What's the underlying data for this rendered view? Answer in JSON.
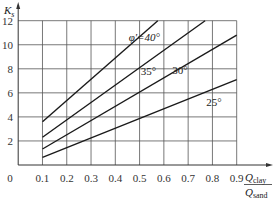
{
  "chart_data": {
    "type": "line",
    "title": "",
    "ylabel": "K_s",
    "ylabel_main": "K",
    "ylabel_sub": "s",
    "xlabel_numerator": "Q",
    "xlabel_numerator_sub": "clay",
    "xlabel_denominator": "Q",
    "xlabel_denominator_sub": "sand",
    "xlim": [
      0,
      0.9
    ],
    "ylim": [
      0,
      12
    ],
    "x_ticks": [
      0.1,
      0.2,
      0.3,
      0.4,
      0.5,
      0.6,
      0.7,
      0.8,
      0.9
    ],
    "x_tick_labels": [
      "0.1",
      "0.2",
      "0.3",
      "0.4",
      "0.5",
      "0.6",
      "0.7",
      "0.8",
      "0.9"
    ],
    "y_ticks": [
      2,
      4,
      6,
      8,
      10,
      12
    ],
    "y_tick_labels": [
      "2",
      "4",
      "6",
      "8",
      "10",
      "12"
    ],
    "origin_label": "0",
    "grid": true,
    "legend": "inline labels",
    "series": [
      {
        "name": "φ'=40°",
        "label": "φ'=40°",
        "x": [
          0.1,
          0.575
        ],
        "y": [
          3.6,
          12.0
        ]
      },
      {
        "name": "35°",
        "label": "35°",
        "x": [
          0.1,
          0.77
        ],
        "y": [
          2.3,
          12.0
        ]
      },
      {
        "name": "30°",
        "label": "30°",
        "x": [
          0.1,
          0.9
        ],
        "y": [
          1.33,
          10.8
        ]
      },
      {
        "name": "25°",
        "label": "25°",
        "x": [
          0.1,
          0.9
        ],
        "y": [
          0.64,
          7.1
        ]
      }
    ]
  }
}
